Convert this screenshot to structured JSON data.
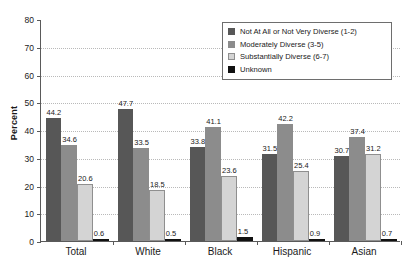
{
  "chart_data": {
    "type": "bar",
    "title": "",
    "xlabel": "",
    "ylabel": "Percent",
    "ylim": [
      0,
      80
    ],
    "yticks": [
      0,
      10,
      20,
      30,
      40,
      50,
      60,
      70,
      80
    ],
    "grid": true,
    "legend_position": "upper-right-inside",
    "categories": [
      "Total",
      "White",
      "Black",
      "Hispanic",
      "Asian"
    ],
    "series": [
      {
        "name": "Not At All or Not Very Diverse (1-2)",
        "color": "#575757",
        "values": [
          44.2,
          47.7,
          33.8,
          31.5,
          30.7
        ]
      },
      {
        "name": "Moderately Diverse (3-5)",
        "color": "#8c8c8c",
        "values": [
          34.6,
          33.5,
          41.1,
          42.2,
          37.4
        ]
      },
      {
        "name": "Substantially Diverse (6-7)",
        "color": "#d4d4d4",
        "values": [
          20.6,
          18.5,
          23.6,
          25.4,
          31.2
        ]
      },
      {
        "name": "Unknown",
        "color": "#111111",
        "values": [
          0.6,
          0.5,
          1.5,
          0.9,
          0.7
        ]
      }
    ]
  }
}
